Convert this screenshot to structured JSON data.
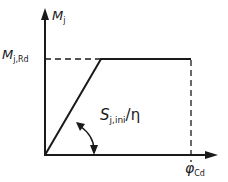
{
  "diagram": {
    "type": "moment-rotation characteristic",
    "colors": {
      "line": "#1a1a1a",
      "background": "#ffffff"
    },
    "axes": {
      "y": {
        "symbol": "M",
        "subscript": "j"
      },
      "x": {
        "symbol": "φ",
        "subscript": "Cd"
      }
    },
    "labels": {
      "resistance": {
        "symbol": "M",
        "subscript": "j,Rd"
      },
      "stiffness": {
        "symbol": "S",
        "subscript": "j,ini",
        "suffix": "/η"
      },
      "rotation_capacity": {
        "symbol": "φ",
        "subscript": "Cd"
      }
    },
    "curve_points": [
      [
        0,
        0
      ],
      [
        1,
        1
      ],
      [
        2.6,
        1
      ]
    ]
  }
}
